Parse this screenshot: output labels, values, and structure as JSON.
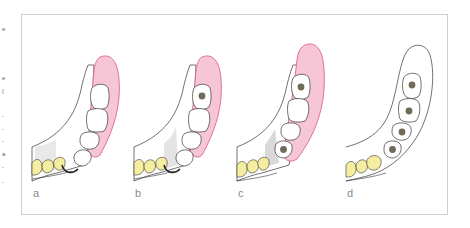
{
  "figure": {
    "panels": [
      {
        "label": "a",
        "implants": 0,
        "gingiva": true
      },
      {
        "label": "b",
        "implants": 1,
        "gingiva": true
      },
      {
        "label": "c",
        "implants": 2,
        "gingiva": true
      },
      {
        "label": "d",
        "implants": 4,
        "gingiva": false
      }
    ]
  },
  "colors": {
    "gingiva_fill": "#f6c6d6",
    "gingiva_stroke": "#e0628c",
    "natural_tooth": "#f5eea0",
    "implant": "#6f6b58",
    "outline": "#333333",
    "frame_border": "#cfcfcf"
  },
  "edge_fragments": [
    "e",
    "e",
    "(",
    "-",
    "-",
    "-",
    "a",
    "-",
    "-"
  ]
}
